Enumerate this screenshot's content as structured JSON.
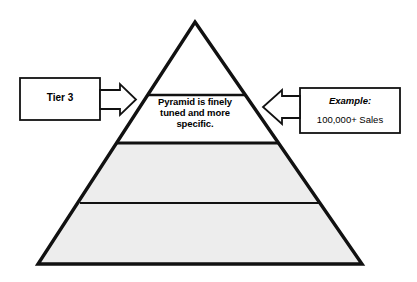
{
  "diagram": {
    "type": "pyramid",
    "colors": {
      "outline": "#111111",
      "tier_fill_upper": "#ffffff",
      "tier_fill_lower": "#ededed",
      "divider": "#111111",
      "box_border": "#111111",
      "box_fill": "#ffffff",
      "text": "#000000"
    },
    "geometry": {
      "apex_x": 195,
      "apex_y": 22,
      "base_left_x": 38,
      "base_right_x": 362,
      "base_y": 264,
      "divider_y_top": 95,
      "divider_y_middle": 143,
      "divider_y_lower": 203
    },
    "tiers": [
      {
        "name": "apex-tier",
        "fill": "white",
        "label": ""
      },
      {
        "name": "text-tier",
        "fill": "white",
        "label": "Pyramid is finely tuned and more specific."
      },
      {
        "name": "middle-tier",
        "fill": "gray",
        "label": ""
      },
      {
        "name": "base-tier",
        "fill": "gray",
        "label": ""
      }
    ]
  },
  "pyramid_band": {
    "text": "Pyramid is finely\ntuned and more\nspecific."
  },
  "left_callout": {
    "label": "Tier 3",
    "arrow_direction": "right"
  },
  "right_callout": {
    "title": "Example:",
    "value": "100,000+ Sales",
    "arrow_direction": "left"
  }
}
